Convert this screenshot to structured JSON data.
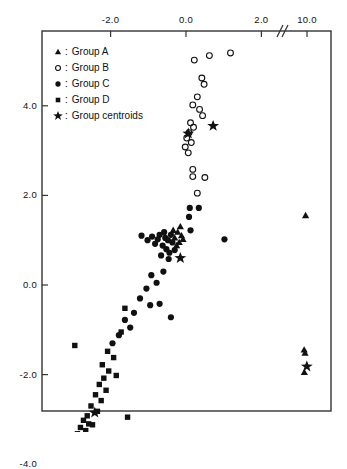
{
  "chart_data": {
    "type": "scatter",
    "title": "",
    "xlabel": "",
    "ylabel": "",
    "xlim": [
      -3.6,
      11.0
    ],
    "ylim": [
      -4.0,
      5.6
    ],
    "x_ticks": [
      -2.0,
      0.0,
      2.0,
      10.0
    ],
    "x_tick_labels": [
      "-2.0",
      "0.0",
      "2.0",
      "10.0"
    ],
    "y_ticks": [
      4.0,
      2.0,
      0.0,
      -2.0,
      -4.0
    ],
    "y_tick_labels": [
      "4.0",
      "2.0",
      "0.0",
      "-2.0",
      "-4.0"
    ],
    "axis_break": {
      "present": true,
      "between": [
        2.0,
        10.0
      ],
      "symbol": "//"
    },
    "grid": false,
    "legend_position": "top-left",
    "series": [
      {
        "name": "Group A",
        "marker": "triangle",
        "filled": true,
        "points": [
          [
            -0.3,
            1.05
          ],
          [
            -0.22,
            1.18
          ],
          [
            -0.18,
            0.95
          ],
          [
            -0.12,
            1.1
          ],
          [
            -0.25,
            0.88
          ],
          [
            -0.08,
            1.02
          ],
          [
            -0.34,
            1.22
          ],
          [
            -0.15,
            1.3
          ],
          [
            9.6,
            1.55
          ],
          [
            9.2,
            -1.45
          ],
          [
            9.45,
            -1.52
          ],
          [
            9.25,
            -1.95
          ],
          [
            10.55,
            -3.85
          ]
        ]
      },
      {
        "name": "Group B",
        "marker": "circle-open",
        "filled": false,
        "points": [
          [
            0.22,
            5.02
          ],
          [
            0.62,
            5.12
          ],
          [
            1.18,
            5.18
          ],
          [
            0.42,
            4.62
          ],
          [
            0.48,
            4.48
          ],
          [
            0.3,
            4.2
          ],
          [
            0.18,
            4.02
          ],
          [
            0.36,
            3.92
          ],
          [
            0.44,
            3.78
          ],
          [
            0.12,
            3.62
          ],
          [
            0.2,
            3.52
          ],
          [
            0.08,
            3.4
          ],
          [
            0.02,
            3.28
          ],
          [
            0.14,
            3.18
          ],
          [
            -0.02,
            3.08
          ],
          [
            0.06,
            2.95
          ],
          [
            0.18,
            2.58
          ],
          [
            0.18,
            2.42
          ],
          [
            0.5,
            2.4
          ],
          [
            0.3,
            2.05
          ]
        ]
      },
      {
        "name": "Group C",
        "marker": "circle-filled",
        "filled": true,
        "points": [
          [
            0.1,
            1.72
          ],
          [
            0.34,
            1.72
          ],
          [
            0.08,
            1.52
          ],
          [
            0.12,
            1.22
          ],
          [
            -0.55,
            1.05
          ],
          [
            -0.7,
            1.12
          ],
          [
            -0.82,
            0.92
          ],
          [
            -0.62,
            0.88
          ],
          [
            -0.48,
            1.0
          ],
          [
            -0.52,
            0.8
          ],
          [
            -0.44,
            0.72
          ],
          [
            -0.66,
            0.66
          ],
          [
            -0.58,
            1.18
          ],
          [
            -0.4,
            1.12
          ],
          [
            -0.75,
            1.02
          ],
          [
            -0.9,
            1.08
          ],
          [
            -0.36,
            0.95
          ],
          [
            -0.46,
            0.58
          ],
          [
            -0.3,
            0.78
          ],
          [
            -1.02,
            1.0
          ],
          [
            -1.18,
            1.1
          ],
          [
            1.02,
            1.02
          ],
          [
            -0.6,
            0.3
          ],
          [
            -0.92,
            0.22
          ],
          [
            -0.78,
            0.05
          ],
          [
            -1.05,
            -0.08
          ],
          [
            -1.22,
            -0.3
          ],
          [
            -0.95,
            -0.45
          ],
          [
            -0.7,
            -0.42
          ],
          [
            -1.38,
            -0.62
          ],
          [
            -1.62,
            -0.78
          ],
          [
            -1.48,
            -0.95
          ],
          [
            -0.4,
            -0.72
          ],
          [
            -1.78,
            -1.12
          ],
          [
            -1.95,
            -1.3
          ]
        ]
      },
      {
        "name": "Group D",
        "marker": "square",
        "filled": true,
        "points": [
          [
            -1.72,
            -1.05
          ],
          [
            -2.08,
            -1.48
          ],
          [
            -1.92,
            -1.62
          ],
          [
            -2.22,
            -1.78
          ],
          [
            -2.05,
            -1.92
          ],
          [
            -2.18,
            -2.08
          ],
          [
            -1.85,
            -2.02
          ],
          [
            -2.3,
            -2.22
          ],
          [
            -2.12,
            -2.35
          ],
          [
            -2.4,
            -2.45
          ],
          [
            -2.25,
            -2.58
          ],
          [
            -2.52,
            -2.7
          ],
          [
            -2.35,
            -2.82
          ],
          [
            -2.62,
            -2.92
          ],
          [
            -2.72,
            -3.02
          ],
          [
            -2.58,
            -3.1
          ],
          [
            -2.8,
            -3.18
          ],
          [
            -2.66,
            -3.25
          ],
          [
            -2.88,
            -3.32
          ],
          [
            -2.74,
            -3.4
          ],
          [
            -2.62,
            -3.48
          ],
          [
            -2.82,
            -3.55
          ],
          [
            -2.55,
            -3.62
          ],
          [
            -2.7,
            -3.72
          ],
          [
            -2.48,
            -3.12
          ],
          [
            -1.55,
            -2.95
          ],
          [
            -2.95,
            -1.35
          ],
          [
            -1.62,
            -0.52
          ]
        ]
      },
      {
        "name": "Group centroids",
        "marker": "star",
        "filled": true,
        "points": [
          [
            -0.15,
            0.6
          ],
          [
            0.06,
            3.38
          ],
          [
            0.72,
            3.55
          ],
          [
            -2.42,
            -2.85
          ],
          [
            9.95,
            -1.82
          ]
        ]
      }
    ]
  },
  "legend": {
    "separator": ":",
    "items": [
      {
        "symbol": "triangle",
        "label": "Group A"
      },
      {
        "symbol": "circle-open",
        "label": "Group B"
      },
      {
        "symbol": "circle-filled",
        "label": "Group C"
      },
      {
        "symbol": "square",
        "label": "Group D"
      },
      {
        "symbol": "star",
        "label": "Group centroids"
      }
    ]
  },
  "axis": {
    "break_symbol": "//"
  },
  "colors": {
    "ink": "#111111",
    "frame": "#333333",
    "background": "#ffffff"
  }
}
